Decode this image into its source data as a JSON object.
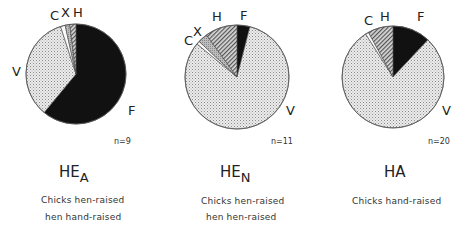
{
  "chart_data": [
    {
      "type": "pie",
      "title": "HE_A",
      "title_main": "HE",
      "title_sub": "A",
      "caption": [
        "Chicks hen-raised",
        "hen hand-raised"
      ],
      "n_label": "n = 9",
      "start_angle_deg": 0,
      "direction": "clockwise",
      "slices": [
        {
          "label": "F",
          "value": 61,
          "fill": "black"
        },
        {
          "label": "V",
          "value": 34,
          "fill": "dotted-light"
        },
        {
          "label": "C",
          "value": 1.5,
          "fill": "white"
        },
        {
          "label": "X",
          "value": 1.5,
          "fill": "grey-stipple"
        },
        {
          "label": "H",
          "value": 2,
          "fill": "hatched"
        }
      ]
    },
    {
      "type": "pie",
      "title": "HE_N",
      "title_main": "HE",
      "title_sub": "N",
      "caption": [
        "Chicks hen-raised",
        "hen hen-raised"
      ],
      "n_label": "n = 11",
      "start_angle_deg": 0,
      "direction": "clockwise",
      "slices": [
        {
          "label": "F",
          "value": 4,
          "fill": "black"
        },
        {
          "label": "V",
          "value": 82,
          "fill": "dotted-light"
        },
        {
          "label": "C",
          "value": 1,
          "fill": "white"
        },
        {
          "label": "X",
          "value": 3,
          "fill": "grey-stipple"
        },
        {
          "label": "H",
          "value": 10,
          "fill": "hatched"
        }
      ]
    },
    {
      "type": "pie",
      "title": "HA",
      "title_main": "HA",
      "title_sub": "",
      "caption": [
        "Chicks hand-raised"
      ],
      "n_label": "n = 20",
      "start_angle_deg": 0,
      "direction": "clockwise",
      "slices": [
        {
          "label": "F",
          "value": 12,
          "fill": "black"
        },
        {
          "label": "V",
          "value": 79,
          "fill": "dotted-light"
        },
        {
          "label": "C",
          "value": 1,
          "fill": "white"
        },
        {
          "label": "H",
          "value": 8,
          "fill": "hatched"
        }
      ]
    }
  ],
  "panels": [
    {
      "title_main": "HE",
      "title_sub": "A",
      "n": "n=9",
      "caption1": "Chicks hen-raised",
      "caption2": "hen hand-raised",
      "labels": {
        "C": "C",
        "X": "X",
        "H": "H",
        "V": "V",
        "F": "F"
      }
    },
    {
      "title_main": "HE",
      "title_sub": "N",
      "n": "n=11",
      "caption1": "Chicks hen-raised",
      "caption2": "hen hen-raised",
      "labels": {
        "C": "C",
        "X": "X",
        "H": "H",
        "V": "V",
        "F": "F"
      }
    },
    {
      "title_main": "HA",
      "title_sub": "",
      "n": "n=20",
      "caption1": "Chicks hand-raised",
      "caption2": "",
      "labels": {
        "C": "C",
        "H": "H",
        "V": "V",
        "F": "F"
      }
    }
  ]
}
